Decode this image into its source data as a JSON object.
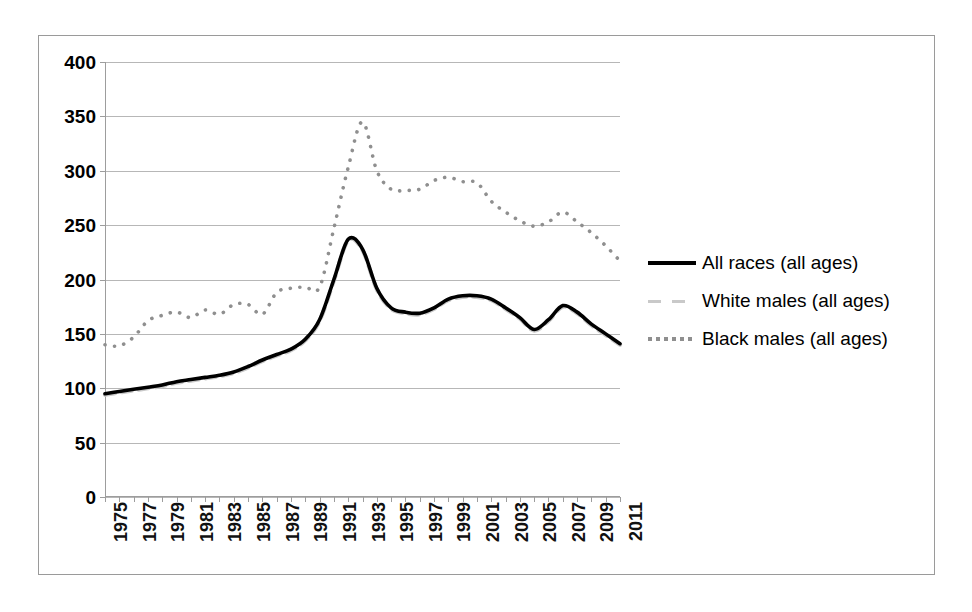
{
  "chart_data": {
    "type": "line",
    "title": "",
    "subtitle": "",
    "xlabel": "",
    "ylabel": "",
    "xlim": [
      1975,
      2011
    ],
    "ylim": [
      0,
      400
    ],
    "grid": true,
    "legend_position": "right",
    "y_ticks": [
      0,
      50,
      100,
      150,
      200,
      250,
      300,
      350,
      400
    ],
    "y_tick_labels": [
      "0",
      "50",
      "100",
      "150",
      "200",
      "250",
      "300",
      "350",
      "400"
    ],
    "x": [
      1975,
      1976,
      1977,
      1978,
      1979,
      1980,
      1981,
      1982,
      1983,
      1984,
      1985,
      1986,
      1987,
      1988,
      1989,
      1990,
      1991,
      1992,
      1993,
      1994,
      1995,
      1996,
      1997,
      1998,
      1999,
      2000,
      2001,
      2002,
      2003,
      2004,
      2005,
      2006,
      2007,
      2008,
      2009,
      2010,
      2011
    ],
    "x_tick_labels": [
      "1975",
      "1977",
      "1979",
      "1981",
      "1983",
      "1985",
      "1987",
      "1989",
      "1991",
      "1993",
      "1995",
      "1997",
      "1999",
      "2001",
      "2003",
      "2005",
      "2007",
      "2009",
      "2011"
    ],
    "series": [
      {
        "name": "All races (all ages)",
        "style": "solid",
        "color": "#000000",
        "values": [
          95,
          97,
          99,
          101,
          103,
          106,
          108,
          110,
          112,
          115,
          120,
          126,
          131,
          136,
          145,
          163,
          200,
          237,
          228,
          192,
          174,
          170,
          169,
          174,
          182,
          185,
          185,
          182,
          174,
          165,
          154,
          163,
          176,
          170,
          159,
          150,
          141
        ]
      },
      {
        "name": "White males (all ages)",
        "style": "dashed",
        "color": "#c9c9c9",
        "values": [
          94,
          96,
          98,
          100,
          102,
          105,
          107,
          109,
          111,
          114,
          119,
          125,
          130,
          135,
          144,
          162,
          199,
          236,
          227,
          191,
          173,
          169,
          168,
          173,
          181,
          184,
          184,
          181,
          173,
          164,
          153,
          162,
          175,
          169,
          158,
          149,
          140
        ]
      },
      {
        "name": "Black males (all ages)",
        "style": "dotted",
        "color": "#8f8f8f",
        "values": [
          140,
          139,
          147,
          162,
          167,
          170,
          165,
          172,
          168,
          177,
          177,
          168,
          188,
          192,
          193,
          193,
          247,
          303,
          345,
          300,
          283,
          282,
          283,
          291,
          294,
          290,
          289,
          272,
          262,
          254,
          249,
          253,
          262,
          253,
          243,
          231,
          217
        ]
      }
    ]
  },
  "legend": {
    "items": [
      {
        "label": "All races (all ages)",
        "style": "solid"
      },
      {
        "label": "White males (all ages)",
        "style": "dashed"
      },
      {
        "label": "Black males (all ages)",
        "style": "dotted"
      }
    ]
  }
}
